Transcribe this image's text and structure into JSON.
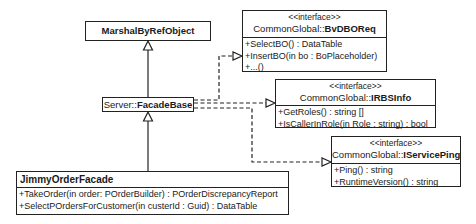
{
  "diagram": {
    "type": "UML class diagram",
    "classes": {
      "marshal": {
        "name": "MarshalByRefObject"
      },
      "facade_base": {
        "namespace": "Server::",
        "name": "FacadeBase"
      },
      "jimmy": {
        "name": "JimmyOrderFacade",
        "operations": [
          "+TakeOrder(in order: POrderBuilder) : POrderDiscrepancyReport",
          "+SelectPOrdersForCustomer(in custerId : Guid) : DataTable"
        ]
      }
    },
    "interfaces": {
      "bvdboreq": {
        "stereotype": "<<interface>>",
        "namespace": "CommonGlobal::",
        "name": "BvDBOReq",
        "operations": [
          "+SelectBO() : DataTable",
          "+InsertBO(in bo : BoPlaceholder)",
          "+...()"
        ]
      },
      "irbsinfo": {
        "stereotype": "<<interface>>",
        "namespace": "CommonGlobal::",
        "name": "IRBSInfo",
        "operations": [
          "+GetRoles() : string []",
          "+IsCallerInRole(in Role : string) : bool"
        ]
      },
      "iserviceping": {
        "stereotype": "<<interface>>",
        "namespace": "CommonGlobal::",
        "name": "IServicePing",
        "operations": [
          "+Ping() : string",
          "+RuntimeVersion() : string"
        ]
      }
    },
    "relationships": [
      {
        "type": "generalization",
        "from": "FacadeBase",
        "to": "MarshalByRefObject"
      },
      {
        "type": "generalization",
        "from": "JimmyOrderFacade",
        "to": "FacadeBase"
      },
      {
        "type": "realization",
        "from": "FacadeBase",
        "to": "BvDBOReq"
      },
      {
        "type": "realization",
        "from": "FacadeBase",
        "to": "IRBSInfo"
      },
      {
        "type": "realization",
        "from": "FacadeBase",
        "to": "IServicePing"
      }
    ]
  }
}
